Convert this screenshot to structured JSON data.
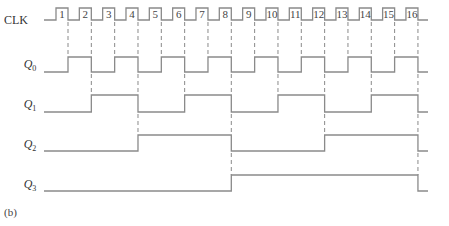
{
  "diagram": {
    "type": "timing-diagram",
    "caption": "(b)",
    "clock": {
      "label": "CLK",
      "pulses": [
        "1",
        "2",
        "3",
        "4",
        "5",
        "6",
        "7",
        "8",
        "9",
        "10",
        "11",
        "12",
        "13",
        "14",
        "15",
        "16"
      ]
    },
    "signals": [
      {
        "name": "Q",
        "subscript": "0",
        "toggles_on_pulses": [
          1,
          2,
          3,
          4,
          5,
          6,
          7,
          8,
          9,
          10,
          11,
          12,
          13,
          14,
          15,
          16
        ],
        "initial": 0
      },
      {
        "name": "Q",
        "subscript": "1",
        "toggles_on_pulses": [
          2,
          4,
          6,
          8,
          10,
          12,
          14,
          16
        ],
        "initial": 0
      },
      {
        "name": "Q",
        "subscript": "2",
        "toggles_on_pulses": [
          4,
          8,
          12,
          16
        ],
        "initial": 0
      },
      {
        "name": "Q",
        "subscript": "3",
        "toggles_on_pulses": [
          8,
          16
        ],
        "initial": 0
      }
    ],
    "colors": {
      "line": "#8a8a8a",
      "text": "#333333"
    }
  }
}
